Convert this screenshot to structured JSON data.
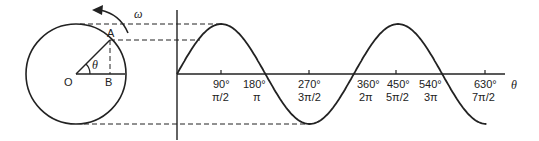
{
  "diagram": {
    "circle": {
      "center_label": "O",
      "point_a_label": "A",
      "point_b_label": "B",
      "angle_label": "θ",
      "angular_velocity_label": "ω"
    },
    "axis": {
      "x_label": "θ",
      "ticks": [
        {
          "deg": "90°",
          "rad": "π/2"
        },
        {
          "deg": "180°",
          "rad": "π"
        },
        {
          "deg": "270°",
          "rad": "3π/2"
        },
        {
          "deg": "360°",
          "rad": "2π"
        },
        {
          "deg": "450°",
          "rad": "5π/2"
        },
        {
          "deg": "540°",
          "rad": "3π"
        },
        {
          "deg": "630°",
          "rad": "7π/2"
        }
      ]
    },
    "colors": {
      "stroke": "#222222",
      "background": "#ffffff"
    }
  }
}
